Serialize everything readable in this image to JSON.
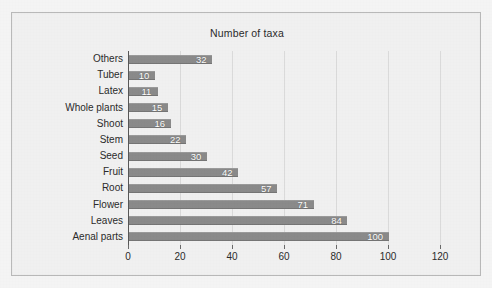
{
  "figure": {
    "title": "Number of taxa",
    "frame_border_color": "#b9b9b9",
    "background_color": "#f0f0f0",
    "bar_color": "#8a8a8a",
    "value_label_color": "#ffffff",
    "gridline_color": "#dadada"
  },
  "chart_data": {
    "type": "bar",
    "orientation": "horizontal",
    "title": "Number of taxa",
    "xlabel": "",
    "ylabel": "",
    "xlim": [
      0,
      120
    ],
    "xticks": [
      0,
      20,
      40,
      60,
      80,
      100,
      120
    ],
    "grid": true,
    "legend": null,
    "data_labels_shown": true,
    "categories": [
      "Others",
      "Tuber",
      "Latex",
      "Whole plants",
      "Shoot",
      "Stem",
      "Seed",
      "Fruit",
      "Root",
      "Flower",
      "Leaves",
      "Aenal parts"
    ],
    "values": [
      32,
      10,
      11,
      15,
      16,
      22,
      30,
      42,
      57,
      71,
      84,
      100
    ],
    "value_labels": [
      "32",
      "10",
      "11",
      "15",
      "16",
      "22",
      "30",
      "42",
      "57",
      "71",
      "84",
      "100"
    ],
    "tick_labels": [
      "0",
      "20",
      "40",
      "60",
      "80",
      "100",
      "120"
    ]
  }
}
